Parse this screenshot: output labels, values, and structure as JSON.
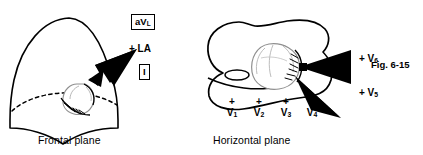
{
  "figure": {
    "number": "Fig. 6-15",
    "background_color": "#ffffff",
    "ink_color": "#000000",
    "faint_ink_color": "#9a9a9a"
  },
  "panels": [
    {
      "id": "frontal",
      "caption": "Frontal plane",
      "shape": "dome-torso-frontal",
      "labels": [
        {
          "name": "avl",
          "text": "aVL",
          "boxed": true,
          "base": "aV",
          "subscript": "L"
        },
        {
          "name": "la",
          "text": "+ LA",
          "boxed": false
        },
        {
          "name": "lead-one",
          "text": "I",
          "boxed": true
        }
      ],
      "arrows": [
        {
          "name": "la-arrow",
          "direction": "down-left",
          "style": "solid-filled"
        }
      ]
    },
    {
      "id": "horizontal",
      "caption": "Horizontal plane",
      "shape": "bean-torso-cross-section",
      "labels": [
        {
          "name": "v6",
          "text": "+ V6",
          "base": "+ V",
          "subscript": "6"
        },
        {
          "name": "v5",
          "text": "+ V5",
          "base": "+ V",
          "subscript": "5"
        }
      ],
      "arrows": [
        {
          "name": "v6-arrow",
          "direction": "left",
          "style": "solid-filled"
        },
        {
          "name": "v5-arrow",
          "direction": "up-left",
          "style": "solid-filled"
        }
      ],
      "precordial_leads": [
        {
          "name": "v1",
          "plus": "+",
          "base": "V",
          "subscript": "1"
        },
        {
          "name": "v2",
          "plus": "+",
          "base": "V",
          "subscript": "2"
        },
        {
          "name": "v3",
          "plus": "+",
          "base": "V",
          "subscript": "3"
        },
        {
          "name": "v4",
          "plus": "+",
          "base": "V",
          "subscript": "4"
        }
      ]
    }
  ]
}
